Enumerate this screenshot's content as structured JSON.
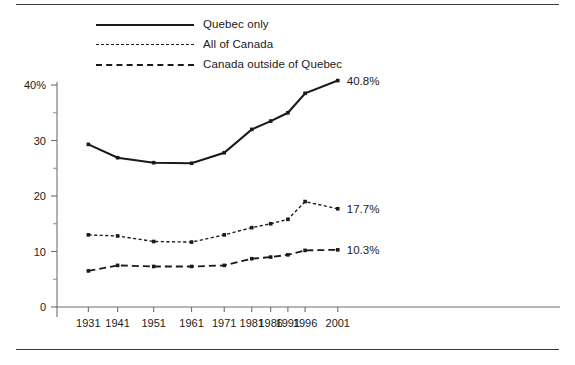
{
  "figure": {
    "has_top_rule": true,
    "has_bottom_rule": true,
    "background": "#ffffff",
    "ink_color": "#1a1a1a",
    "axis_color": "#6e6e6e"
  },
  "legend": {
    "position": "top-left",
    "entries": [
      {
        "label": "Quebec only",
        "style": "solid",
        "icon": "solid-line-icon"
      },
      {
        "label": "All of Canada",
        "style": "dotted",
        "icon": "dotted-line-icon"
      },
      {
        "label": "Canada outside of Quebec",
        "style": "dashed",
        "icon": "dashed-line-icon"
      }
    ]
  },
  "chart_data": {
    "type": "line",
    "title": "",
    "subtitle": "",
    "xlabel": "",
    "ylabel": "",
    "categories": [
      "1931",
      "1941",
      "1951",
      "1961",
      "1971",
      "1981",
      "1986",
      "1991",
      "1996",
      "2001"
    ],
    "x_tick_labels": [
      "1931",
      "1941",
      "1951",
      "1961",
      "1971",
      "1981",
      "1986",
      "1991",
      "1996",
      "2001"
    ],
    "x_positions_px": [
      88,
      105,
      126,
      148,
      167,
      183,
      194,
      204,
      214,
      233
    ],
    "y_tick_labels": [
      "40%",
      "30",
      "20",
      "10",
      "0"
    ],
    "y_tick_values": [
      40,
      30,
      20,
      10,
      0
    ],
    "y_minor_tick_values": [
      35,
      25,
      15,
      5
    ],
    "ylim": [
      0,
      42
    ],
    "grid": false,
    "legend_position": "top-left",
    "markers": true,
    "series": [
      {
        "name": "Quebec only",
        "style": "solid",
        "values": [
          29.3,
          26.9,
          26.0,
          25.9,
          27.8,
          32.0,
          33.5,
          35.0,
          38.5,
          40.8
        ],
        "end_label": "40.8%"
      },
      {
        "name": "All of Canada",
        "style": "dotted",
        "values": [
          13.0,
          12.8,
          11.8,
          11.7,
          13.0,
          14.3,
          15.0,
          15.8,
          19.0,
          17.7
        ],
        "end_label": "17.7%"
      },
      {
        "name": "Canada outside of Quebec",
        "style": "dashed",
        "values": [
          6.5,
          7.5,
          7.3,
          7.3,
          7.5,
          8.7,
          9.0,
          9.4,
          10.2,
          10.3
        ],
        "end_label": "10.3%"
      }
    ]
  }
}
